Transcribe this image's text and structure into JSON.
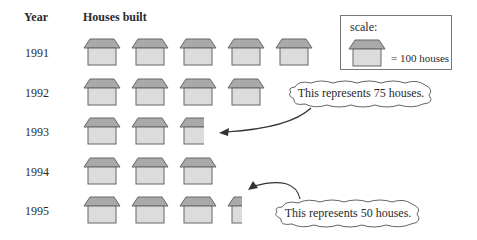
{
  "headers": {
    "year": "Year",
    "houses": "Houses built"
  },
  "legend": {
    "title": "scale:",
    "value_text": "= 100 houses"
  },
  "callouts": [
    {
      "text": "This represents 75 houses.",
      "target_year": "1993"
    },
    {
      "text": "This represents 50 houses.",
      "target_year": "1995"
    }
  ],
  "colors": {
    "roof": "#a9a9a9",
    "body": "#dcdcdc",
    "stroke": "#666666"
  },
  "chart_data": {
    "type": "pictograph",
    "title": "Houses built",
    "xlabel": "Houses built",
    "ylabel": "Year",
    "unit": "1 icon = 100 houses",
    "categories": [
      "1991",
      "1992",
      "1993",
      "1994",
      "1995"
    ],
    "icons": [
      5,
      4,
      2.75,
      3,
      3.5
    ],
    "values": [
      500,
      400,
      275,
      300,
      350
    ],
    "annotations": [
      {
        "text": "This represents 75 houses.",
        "points_to": "1993 partial icon"
      },
      {
        "text": "This represents 50 houses.",
        "points_to": "1995 partial icon"
      }
    ]
  }
}
